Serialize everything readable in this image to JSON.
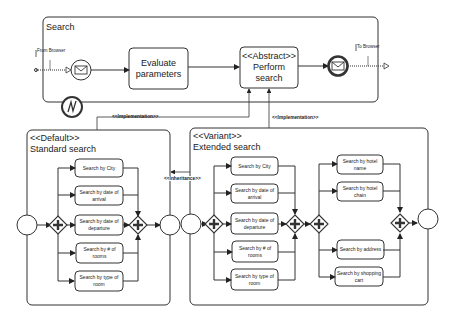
{
  "pool": {
    "title": "Search"
  },
  "top_flow": {
    "from_label": "From Browser",
    "to_label": "To Browser",
    "start_event": "message-start-event",
    "end_event": "message-end-event",
    "link_event": "N",
    "task_evaluate": "Evaluate parameters",
    "task_abstract_stereotype": "<<Abstract>>",
    "task_abstract_name": "Perform search"
  },
  "relations": {
    "implementation_left": "<<Implementation>>",
    "implementation_right": "<<Implementation>>",
    "inheritance": "<<Inheritance>>"
  },
  "default_subprocess": {
    "stereotype": "<<Default>>",
    "title": "Standard search",
    "tasks": [
      "Search by City",
      "Search by date of arrival",
      "Search by date of departure",
      "Search by # of rooms",
      "Search by type of room"
    ]
  },
  "variant_subprocess": {
    "stereotype": "<<Variant>>",
    "title": "Extended search",
    "tasks_left": [
      "Search by City",
      "Search by date of arrival",
      "Search by date of departure",
      "Search by # of rooms",
      "Search by type of room"
    ],
    "tasks_right": [
      "Search by hotel name",
      "Search by hotel chain",
      "Search by address",
      "Search by shopping cart"
    ]
  }
}
